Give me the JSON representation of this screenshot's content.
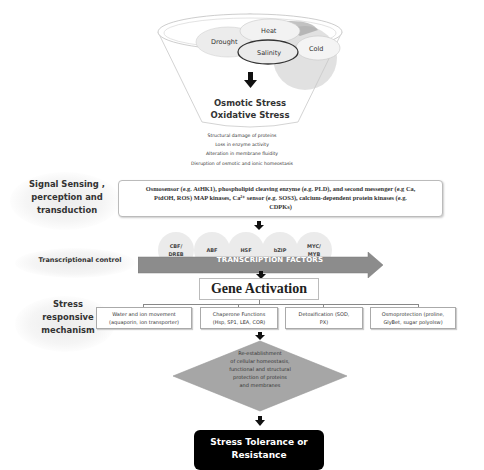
{
  "funnel": {
    "stressors": [
      "Drought",
      "Heat",
      "Salinity",
      "Cold"
    ],
    "primary_stresses": [
      "Osmotic Stress",
      "Oxidative Stress"
    ],
    "effects": [
      "Structural damage of proteins",
      "Loss in enzyme activity",
      "Alteration in membrane fluidity",
      "Disruption of osmotic and ionic homeostasis"
    ]
  },
  "signal": {
    "label": "Signal Sensing , perception and transduction",
    "label_lines": [
      "Signal Sensing ,",
      "perception and",
      "transduction"
    ],
    "text": "Osmosensor (e.g. AtHK1), phospholipid cleaving enzyme (e.g. PLD), and second messenger (e.g Ca, PtdOH, ROS) MAP kinases, Ca2+ sensor (e.g. SOS3), calcium-dependent protein kinases (e.g. CDPKs)",
    "text_lines": [
      "Osmosensor (e.g. AtHK1), phospholipid cleaving enzyme (e.g. PLD), and second messenger (e.g Ca,",
      "PtdOH, ROS)  MAP kinases, Ca²⁺ sensor (e.g. SOS3), calcium-dependent protein kinases (e.g.",
      "CDPKs)"
    ]
  },
  "transcription": {
    "label": "Transcriptional control",
    "factors": [
      {
        "lines": [
          "CBF/",
          "DREB"
        ]
      },
      {
        "lines": [
          "ABF"
        ]
      },
      {
        "lines": [
          "HSF"
        ]
      },
      {
        "lines": [
          "bZIP"
        ]
      },
      {
        "lines": [
          "MYC/",
          "MYB"
        ]
      }
    ],
    "arrow_label": "TRANSCRIPTION FACTORS",
    "arrow_color": "#8c8c8c"
  },
  "gene_activation": {
    "label": "Gene Activation"
  },
  "mechanism": {
    "label_lines": [
      "Stress",
      "responsive",
      "mechanism"
    ],
    "boxes": [
      {
        "lines": [
          "Water and ion movement",
          "(aquaporin, ion transporter)"
        ]
      },
      {
        "lines": [
          "Chaperone  Functions",
          "(Hsp, SP1, LEA, COR)"
        ]
      },
      {
        "lines": [
          "Detoxification  (SOD,",
          "PX)"
        ]
      },
      {
        "lines": [
          "Osmoprotection (proline,",
          "GlyBet, sugar polyolsw)"
        ]
      }
    ]
  },
  "outcome": {
    "diamond_lines": [
      "Re-establishment",
      "of cellular  homeostasis,",
      "functional and structural",
      "protection of proteins",
      "and membranes"
    ],
    "diamond_color": "#a6a6a6",
    "final_lines": [
      "Stress Tolerance or",
      "Resistance"
    ],
    "final_color": "#000000"
  }
}
